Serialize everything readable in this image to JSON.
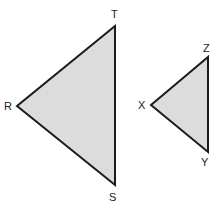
{
  "diagram": {
    "colors": {
      "fill": "#dcdcdc",
      "stroke": "#1a1a1a",
      "label": "#222222",
      "background": "#ffffff"
    },
    "triangles": [
      {
        "name": "RST",
        "vertices": [
          {
            "label": "T",
            "x": 115,
            "y": 26
          },
          {
            "label": "R",
            "x": 17,
            "y": 106
          },
          {
            "label": "S",
            "x": 115,
            "y": 185
          }
        ]
      },
      {
        "name": "XYZ",
        "vertices": [
          {
            "label": "Z",
            "x": 208,
            "y": 57
          },
          {
            "label": "X",
            "x": 151,
            "y": 105
          },
          {
            "label": "Y",
            "x": 208,
            "y": 152
          }
        ]
      }
    ],
    "labels": {
      "T": "T",
      "R": "R",
      "S": "S",
      "Z": "Z",
      "X": "X",
      "Y": "Y"
    }
  }
}
